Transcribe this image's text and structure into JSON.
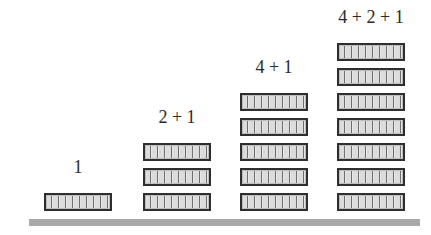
{
  "diagram": {
    "colors": {
      "background": "#ffffff",
      "block_border": "#2e2e2e",
      "block_fill": "#dcdcdc",
      "ground": "#a9a9a9",
      "text": "#2a2a2a"
    },
    "stacks": [
      {
        "label": "1",
        "block_count": 1
      },
      {
        "label": "2 + 1",
        "block_count": 3
      },
      {
        "label": "4 + 1",
        "block_count": 5
      },
      {
        "label": "4 + 2 + 1",
        "block_count": 7
      }
    ]
  }
}
